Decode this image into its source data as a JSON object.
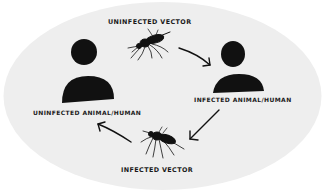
{
  "diagram": {
    "type": "transmission-cycle",
    "background_color": "#eeeeee",
    "ink_color": "#111111",
    "nodes": [
      {
        "id": "uninfected-vector",
        "label": "UNINFECTED VECTOR",
        "icon": "mosquito-icon"
      },
      {
        "id": "infected-host",
        "label": "INFECTED ANIMAL/HUMAN",
        "icon": "person-icon"
      },
      {
        "id": "infected-vector",
        "label": "INFECTED VECTOR",
        "icon": "mosquito-icon"
      },
      {
        "id": "uninfected-host",
        "label": "UNINFECTED ANIMAL/HUMAN",
        "icon": "person-icon"
      }
    ],
    "edges": [
      {
        "from": "uninfected-vector",
        "to": "infected-host"
      },
      {
        "from": "infected-host",
        "to": "infected-vector"
      },
      {
        "from": "infected-vector",
        "to": "uninfected-host"
      }
    ]
  },
  "labels": {
    "uninfected_vector": "UNINFECTED VECTOR",
    "infected_host": "INFECTED ANIMAL/HUMAN",
    "infected_vector": "INFECTED VECTOR",
    "uninfected_host": "UNINFECTED ANIMAL/HUMAN"
  }
}
